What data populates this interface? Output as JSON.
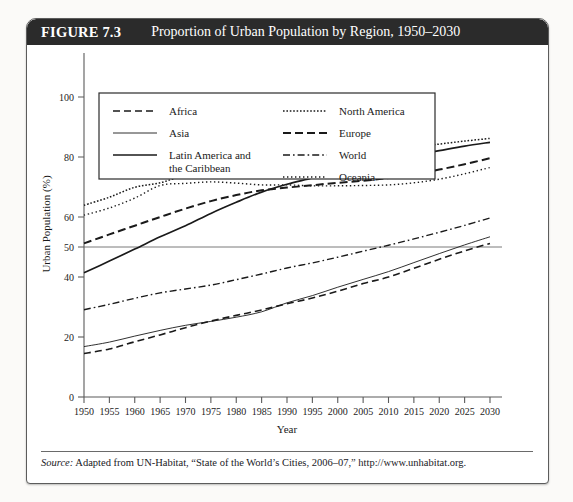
{
  "figure": {
    "number": "FIGURE 7.3",
    "title": "Proportion of Urban Population by Region, 1950–2030",
    "source_label": "Source:",
    "source_text": " Adapted from UN-Habitat, “State of the World’s Cities, 2006–07,” http://www.unhabitat.org."
  },
  "chart_data": {
    "type": "line",
    "title": "Proportion of Urban Population by Region, 1950–2030",
    "xlabel": "Year",
    "ylabel": "Urban Population (%)",
    "xlim": [
      1950,
      2030
    ],
    "ylim": [
      0,
      110
    ],
    "xticks": [
      1950,
      1955,
      1960,
      1965,
      1970,
      1975,
      1980,
      1985,
      1990,
      1995,
      2000,
      2005,
      2010,
      2015,
      2020,
      2025,
      2030
    ],
    "yticks": [
      0,
      20,
      40,
      50,
      60,
      80,
      100
    ],
    "ytick_labels": [
      "0",
      "20",
      "40",
      "50",
      "60",
      "80",
      "100"
    ],
    "grid": false,
    "reference_line": {
      "y": 50,
      "label": "50% urban"
    },
    "legend_position": "top-inside",
    "x": [
      1950,
      1955,
      1960,
      1965,
      1970,
      1975,
      1980,
      1985,
      1990,
      1995,
      2000,
      2005,
      2010,
      2015,
      2020,
      2025,
      2030
    ],
    "series": [
      {
        "name": "Africa",
        "style": "dashed",
        "values": [
          14.5,
          16.0,
          18.4,
          20.7,
          23.1,
          25.3,
          27.2,
          29.0,
          31.1,
          33.0,
          35.3,
          37.8,
          40.0,
          42.9,
          45.9,
          48.7,
          51.2
        ]
      },
      {
        "name": "Asia",
        "style": "thin-solid",
        "values": [
          16.8,
          18.3,
          20.3,
          22.2,
          23.9,
          25.2,
          26.6,
          28.4,
          31.4,
          33.8,
          36.6,
          39.2,
          41.8,
          44.8,
          47.8,
          50.7,
          53.4
        ]
      },
      {
        "name": "Latin America and the Caribbean",
        "style": "thick-solid",
        "values": [
          41.4,
          45.3,
          49.3,
          53.4,
          57.1,
          61.2,
          64.9,
          68.3,
          70.9,
          73.0,
          75.3,
          77.2,
          79.0,
          80.6,
          82.1,
          83.6,
          84.9
        ]
      },
      {
        "name": "North America",
        "style": "dotted-fine",
        "values": [
          63.9,
          66.6,
          69.9,
          71.4,
          73.8,
          73.8,
          73.9,
          74.6,
          75.4,
          77.3,
          79.1,
          80.7,
          82.0,
          83.2,
          84.3,
          85.3,
          86.2
        ]
      },
      {
        "name": "Europe",
        "style": "dashed-bold",
        "values": [
          51.2,
          54.2,
          57.1,
          60.0,
          62.8,
          65.3,
          67.3,
          68.9,
          69.8,
          70.6,
          71.4,
          72.1,
          73.0,
          74.2,
          75.8,
          77.6,
          79.6
        ]
      },
      {
        "name": "World",
        "style": "dash-dot",
        "values": [
          29.1,
          30.9,
          32.9,
          34.7,
          36.0,
          37.3,
          39.1,
          41.0,
          43.0,
          44.7,
          46.6,
          48.6,
          50.6,
          52.7,
          54.9,
          57.2,
          59.7
        ]
      },
      {
        "name": "Oceania",
        "style": "dotted-sparse",
        "values": [
          60.6,
          63.0,
          66.3,
          70.5,
          71.2,
          71.7,
          71.3,
          70.7,
          70.7,
          70.4,
          70.4,
          70.5,
          70.7,
          71.4,
          72.6,
          74.4,
          76.5
        ]
      }
    ]
  },
  "legend": {
    "column_left": [
      {
        "label": "Africa",
        "style": "dashed"
      },
      {
        "label": "Asia",
        "style": "thin-solid"
      },
      {
        "label": "Latin America and",
        "label2": "the Caribbean",
        "style": "thick-solid"
      }
    ],
    "column_right": [
      {
        "label": "North America",
        "style": "dotted-fine"
      },
      {
        "label": "Europe",
        "style": "dashed-bold"
      },
      {
        "label": "World",
        "style": "dash-dot"
      },
      {
        "label": "Oceania",
        "style": "dotted-sparse"
      }
    ]
  },
  "colors": {
    "title_bar": "#2b2b2b",
    "title_text": "#ffffff",
    "line": "#1a1a1a",
    "axis": "#5a5a5a",
    "page": "#fbfaf8"
  }
}
